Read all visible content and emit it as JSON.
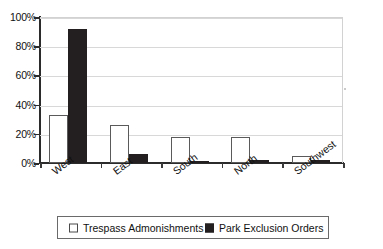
{
  "chart_data": {
    "type": "bar",
    "title": "",
    "subtitle": "",
    "xlabel": "",
    "ylabel": "",
    "categories": [
      "West",
      "East",
      "South",
      "North",
      "Southwest"
    ],
    "series": [
      {
        "name": "Trespass Admonishments",
        "color": "#ffffff",
        "border_color": "#5a5a5a",
        "values": [
          33,
          26,
          17.5,
          17.5,
          5
        ]
      },
      {
        "name": "Park Exclusion Orders",
        "color": "#231f20",
        "border_color": "#231f20",
        "values": [
          92,
          6.5,
          1,
          2,
          2
        ]
      }
    ],
    "ylim": [
      0,
      100
    ],
    "y_ticks": [
      0,
      20,
      40,
      60,
      80,
      100
    ],
    "y_tick_labels": [
      "0%",
      "20%",
      "40%",
      "60%",
      "80%",
      "100%"
    ],
    "value_suffix": "%",
    "grid": true,
    "grid_axis": "y",
    "legend_position": "bottom",
    "x_label_rotation": -37
  }
}
